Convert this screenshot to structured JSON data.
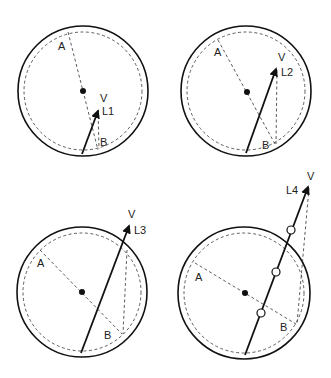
{
  "panels": [
    {
      "id": "L1",
      "labels": {
        "A": "A",
        "B": "B",
        "V": "V",
        "L": "L1"
      }
    },
    {
      "id": "L2",
      "labels": {
        "A": "A",
        "B": "B",
        "V": "V",
        "L": "L2"
      }
    },
    {
      "id": "L3",
      "labels": {
        "A": "A",
        "B": "B",
        "V": "V",
        "L": "L3"
      }
    },
    {
      "id": "L4",
      "labels": {
        "A": "A",
        "B": "B",
        "V": "V",
        "L": "L4"
      }
    }
  ],
  "colors": {
    "stroke": "#111111",
    "background": "#ffffff"
  }
}
